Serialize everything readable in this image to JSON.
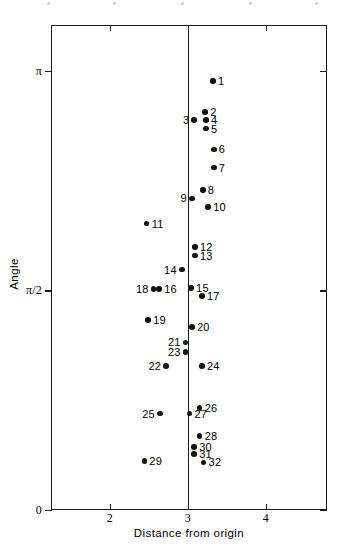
{
  "chart_data": {
    "type": "scatter",
    "title": "",
    "xlabel": "Distance from origin",
    "ylabel": "Angle",
    "xlim": [
      1.52,
      5.06
    ],
    "ylim": [
      0,
      3.4
    ],
    "grid": false,
    "legend": null,
    "xticks": [
      {
        "value": 2,
        "label": "2"
      },
      {
        "value": 3,
        "label": "3"
      },
      {
        "value": 4,
        "label": "4"
      }
    ],
    "yticks": [
      {
        "value": 3.14159,
        "label": "π"
      },
      {
        "value": 1.5708,
        "label": "π/2"
      },
      {
        "value": 0,
        "label": "0"
      }
    ],
    "annotations": [
      {
        "text": "vertical reference line at distance = 3",
        "x": 3
      }
    ],
    "point_color": "#111111",
    "axis_color": "#1a1a1a",
    "points": [
      {
        "label": "1",
        "x": 3.32,
        "y": 3.07,
        "label_side": "right"
      },
      {
        "label": "2",
        "x": 3.22,
        "y": 2.85,
        "label_side": "right"
      },
      {
        "label": "3",
        "x": 3.08,
        "y": 2.79,
        "label_side": "left"
      },
      {
        "label": "4",
        "x": 3.23,
        "y": 2.79,
        "label_side": "right"
      },
      {
        "label": "5",
        "x": 3.23,
        "y": 2.73,
        "label_side": "right"
      },
      {
        "label": "6",
        "x": 3.33,
        "y": 2.58,
        "label_side": "right"
      },
      {
        "label": "7",
        "x": 3.33,
        "y": 2.45,
        "label_side": "right"
      },
      {
        "label": "8",
        "x": 3.19,
        "y": 2.29,
        "label_side": "right"
      },
      {
        "label": "9",
        "x": 3.05,
        "y": 2.23,
        "label_side": "left"
      },
      {
        "label": "10",
        "x": 3.26,
        "y": 2.17,
        "label_side": "right"
      },
      {
        "label": "11",
        "x": 2.47,
        "y": 2.05,
        "label_side": "right"
      },
      {
        "label": "12",
        "x": 3.09,
        "y": 1.88,
        "label_side": "right"
      },
      {
        "label": "13",
        "x": 3.09,
        "y": 1.82,
        "label_side": "right"
      },
      {
        "label": "14",
        "x": 2.92,
        "y": 1.72,
        "label_side": "left"
      },
      {
        "label": "15",
        "x": 3.04,
        "y": 1.59,
        "label_side": "right"
      },
      {
        "label": "16",
        "x": 2.63,
        "y": 1.58,
        "label_side": "right"
      },
      {
        "label": "17",
        "x": 3.18,
        "y": 1.53,
        "label_side": "right"
      },
      {
        "label": "18",
        "x": 2.56,
        "y": 1.58,
        "label_side": "left"
      },
      {
        "label": "19",
        "x": 2.49,
        "y": 1.36,
        "label_side": "right"
      },
      {
        "label": "20",
        "x": 3.05,
        "y": 1.31,
        "label_side": "right"
      },
      {
        "label": "21",
        "x": 2.97,
        "y": 1.2,
        "label_side": "left"
      },
      {
        "label": "22",
        "x": 2.72,
        "y": 1.03,
        "label_side": "left"
      },
      {
        "label": "23",
        "x": 2.97,
        "y": 1.13,
        "label_side": "left"
      },
      {
        "label": "24",
        "x": 3.18,
        "y": 1.03,
        "label_side": "right"
      },
      {
        "label": "25",
        "x": 2.64,
        "y": 0.69,
        "label_side": "left"
      },
      {
        "label": "26",
        "x": 3.15,
        "y": 0.73,
        "label_side": "right"
      },
      {
        "label": "27",
        "x": 3.02,
        "y": 0.69,
        "label_side": "right"
      },
      {
        "label": "28",
        "x": 3.15,
        "y": 0.53,
        "label_side": "right"
      },
      {
        "label": "29",
        "x": 2.44,
        "y": 0.35,
        "label_side": "right"
      },
      {
        "label": "30",
        "x": 3.08,
        "y": 0.45,
        "label_side": "right"
      },
      {
        "label": "31",
        "x": 3.08,
        "y": 0.4,
        "label_side": "right"
      },
      {
        "label": "32",
        "x": 3.2,
        "y": 0.34,
        "label_side": "right"
      }
    ]
  }
}
